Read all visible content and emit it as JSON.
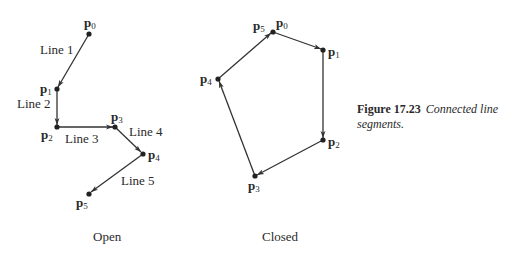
{
  "caption": {
    "number": "Figure 17.23",
    "text_line1": "Connected line",
    "text_line2": "segments."
  },
  "open": {
    "title": "Open",
    "points": [
      {
        "name": "p",
        "sub": "0",
        "x": 89,
        "y": 34
      },
      {
        "name": "p",
        "sub": "1",
        "x": 57,
        "y": 89
      },
      {
        "name": "p",
        "sub": "2",
        "x": 57,
        "y": 127
      },
      {
        "name": "p",
        "sub": "3",
        "x": 115,
        "y": 127
      },
      {
        "name": "p",
        "sub": "4",
        "x": 143,
        "y": 154
      },
      {
        "name": "p",
        "sub": "5",
        "x": 89,
        "y": 194
      }
    ],
    "lines": [
      {
        "label": "Line 1"
      },
      {
        "label": "Line 2"
      },
      {
        "label": "Line 3"
      },
      {
        "label": "Line 4"
      },
      {
        "label": "Line 5"
      }
    ]
  },
  "closed": {
    "title": "Closed",
    "points": [
      {
        "name": "p",
        "sub": "0",
        "x": 273,
        "y": 32
      },
      {
        "name": "p",
        "sub": "1",
        "x": 323,
        "y": 50
      },
      {
        "name": "p",
        "sub": "2",
        "x": 323,
        "y": 140
      },
      {
        "name": "p",
        "sub": "3",
        "x": 255,
        "y": 176
      },
      {
        "name": "p",
        "sub": "4",
        "x": 218,
        "y": 79
      },
      {
        "name": "p",
        "sub": "5",
        "x": 273,
        "y": 32
      }
    ]
  }
}
